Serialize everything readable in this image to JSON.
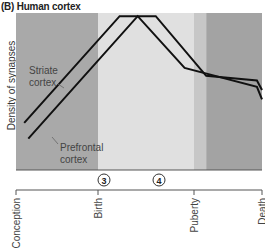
{
  "chart_data": {
    "type": "line",
    "title": "(B) Human cortex",
    "ylabel": "Density of synapses",
    "xlabel": "",
    "x_ticks": [
      "Conception",
      "Birth",
      "Puberty",
      "Death"
    ],
    "markers": [
      {
        "label": "3",
        "position": "birth"
      },
      {
        "label": "4",
        "position": "childhood"
      }
    ],
    "regions": [
      {
        "name": "prenatal",
        "from": 0,
        "to": 1,
        "color": "#a9a9a9"
      },
      {
        "name": "childhood",
        "from": 1,
        "to": 2.33,
        "color": "#e0e0e0"
      },
      {
        "name": "puberty-transition",
        "from": 2.33,
        "to": 2.45,
        "color": "#c7c7c7"
      },
      {
        "name": "adult",
        "from": 2.45,
        "to": 3,
        "color": "#a3a3a3"
      }
    ],
    "series": [
      {
        "name": "Striate cortex",
        "x": [
          0.1,
          1.3,
          1.8,
          2.45,
          2.95,
          3.0
        ],
        "y": [
          0.3,
          0.98,
          0.98,
          0.6,
          0.57,
          0.51
        ]
      },
      {
        "name": "Prefrontal cortex",
        "x": [
          0.15,
          1.55,
          2.2,
          2.95,
          3.0
        ],
        "y": [
          0.2,
          0.98,
          0.65,
          0.53,
          0.45
        ]
      }
    ],
    "ylim": [
      0,
      1
    ],
    "xlim": [
      0,
      3
    ],
    "grid": false,
    "annotations": [
      {
        "text": "Striate\ncortex",
        "series": "Striate cortex"
      },
      {
        "text": "Prefrontal\ncortex",
        "series": "Prefrontal cortex"
      }
    ]
  }
}
